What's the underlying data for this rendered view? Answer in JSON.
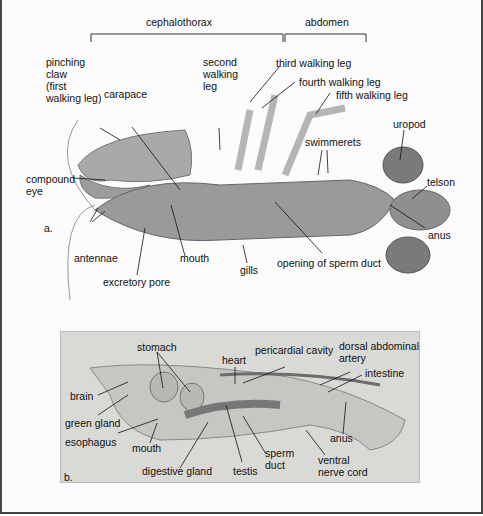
{
  "figure": {
    "panel_a": {
      "marker": "a.",
      "brackets": {
        "cephalothorax": "cephalothorax",
        "abdomen": "abdomen"
      },
      "labels": {
        "pinching_claw": "pinching\nclaw\n(first\nwalking leg)",
        "carapace": "carapace",
        "second_walking_leg": "second\nwalking\nleg",
        "third_walking_leg": "third walking leg",
        "fourth_walking_leg": "fourth walking leg",
        "fifth_walking_leg": "fifth walking leg",
        "uropod": "uropod",
        "swimmerets": "swimmerets",
        "telson": "telson",
        "compound_eye": "compound\neye",
        "anus": "anus",
        "antennae": "antennae",
        "mouth": "mouth",
        "gills": "gills",
        "opening_of_sperm_duct": "opening of sperm duct",
        "excretory_pore": "excretory pore"
      }
    },
    "panel_b": {
      "marker": "b.",
      "labels": {
        "stomach": "stomach",
        "heart": "heart",
        "pericardial_cavity": "pericardial cavity",
        "dorsal_abdominal_artery": "dorsal abdominal\nartery",
        "intestine": "intestine",
        "brain": "brain",
        "green_gland": "green gland",
        "esophagus": "esophagus",
        "mouth": "mouth",
        "anus": "anus",
        "sperm_duct": "sperm\nduct",
        "ventral_nerve_cord": "ventral\nnerve cord",
        "digestive_gland": "digestive gland",
        "testis": "testis"
      }
    },
    "colors": {
      "body_gray": "#9a9a9a",
      "panel_b_bg": "#d9d9d6",
      "line": "#111111"
    }
  }
}
